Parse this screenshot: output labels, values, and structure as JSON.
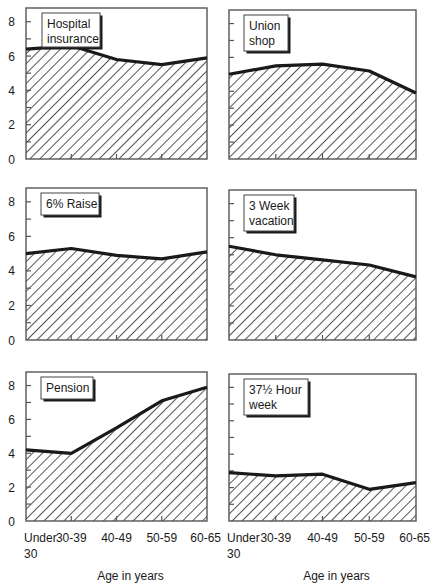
{
  "chart_data": [
    {
      "type": "area",
      "title": "Hospital insurance",
      "title_lines": [
        "Hospital",
        "insurance"
      ],
      "categories": [
        "Under 30",
        "30-39",
        "40-49",
        "50-59",
        "60-65"
      ],
      "values": [
        6.4,
        6.6,
        5.8,
        5.5,
        5.9
      ],
      "ylim": [
        0,
        8.8
      ],
      "yticks": [
        0,
        2,
        4,
        6,
        8
      ],
      "xlabel": "",
      "ylabel": "",
      "grid": false,
      "fill": "diagonal-hatch"
    },
    {
      "type": "area",
      "title": "Union shop",
      "title_lines": [
        "Union",
        "shop"
      ],
      "categories": [
        "Under 30",
        "30-39",
        "40-49",
        "50-59",
        "60-65"
      ],
      "values": [
        5.0,
        5.5,
        5.6,
        5.2,
        3.9
      ],
      "ylim": [
        0,
        8.8
      ],
      "yticks": [
        0,
        2,
        4,
        6,
        8
      ],
      "xlabel": "",
      "ylabel": "",
      "grid": false,
      "fill": "diagonal-hatch"
    },
    {
      "type": "area",
      "title": "6% Raise",
      "title_lines": [
        "6% Raise"
      ],
      "categories": [
        "Under 30",
        "30-39",
        "40-49",
        "50-59",
        "60-65"
      ],
      "values": [
        5.0,
        5.3,
        4.9,
        4.7,
        5.1
      ],
      "ylim": [
        0,
        8.8
      ],
      "yticks": [
        0,
        2,
        4,
        6,
        8
      ],
      "xlabel": "",
      "ylabel": "",
      "grid": false,
      "fill": "diagonal-hatch"
    },
    {
      "type": "area",
      "title": "3 Week vacation",
      "title_lines": [
        "3 Week",
        "vacation"
      ],
      "categories": [
        "Under 30",
        "30-39",
        "40-49",
        "50-59",
        "60-65"
      ],
      "values": [
        5.5,
        5.0,
        4.7,
        4.4,
        3.7
      ],
      "ylim": [
        0,
        8.8
      ],
      "yticks": [
        0,
        2,
        4,
        6,
        8
      ],
      "xlabel": "",
      "ylabel": "",
      "grid": false,
      "fill": "diagonal-hatch"
    },
    {
      "type": "area",
      "title": "Pension",
      "title_lines": [
        "Pension"
      ],
      "categories": [
        "Under 30",
        "30-39",
        "40-49",
        "50-59",
        "60-65"
      ],
      "values": [
        4.2,
        4.0,
        5.5,
        7.1,
        7.9
      ],
      "ylim": [
        0,
        8.8
      ],
      "yticks": [
        0,
        2,
        4,
        6,
        8
      ],
      "xlabel": "Age in years",
      "ylabel": "",
      "grid": false,
      "fill": "diagonal-hatch"
    },
    {
      "type": "area",
      "title": "37½ Hour week",
      "title_lines": [
        "37½ Hour",
        "week"
      ],
      "categories": [
        "Under 30",
        "30-39",
        "40-49",
        "50-59",
        "60-65"
      ],
      "values": [
        2.9,
        2.7,
        2.8,
        1.9,
        2.3
      ],
      "ylim": [
        0,
        8.8
      ],
      "yticks": [
        0,
        2,
        4,
        6,
        8
      ],
      "xlabel": "Age in years",
      "ylabel": "",
      "grid": false,
      "fill": "diagonal-hatch"
    }
  ],
  "axis": {
    "ytick_labels": [
      "0",
      "2",
      "4",
      "6",
      "8"
    ],
    "xtick_labels": [
      [
        "Under",
        "30"
      ],
      [
        "30-39"
      ],
      [
        "40-49"
      ],
      [
        "50-59"
      ],
      [
        "60-65"
      ]
    ],
    "xlabel": "Age in years"
  },
  "colors": {
    "line": "#1a1a1a",
    "hatch": "#2a2a2a",
    "frame": "#555555",
    "background": "#ffffff"
  }
}
